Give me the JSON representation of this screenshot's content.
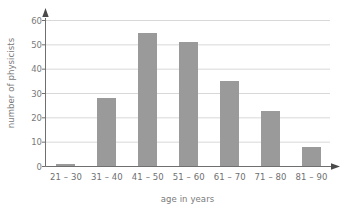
{
  "chart_data": {
    "type": "bar",
    "title": "",
    "subtitle": "",
    "xlabel": "age in years",
    "ylabel": "number of physicists",
    "categories": [
      "21 – 30",
      "31 – 40",
      "41 – 50",
      "51 – 60",
      "61 – 70",
      "71 – 80",
      "81 – 90"
    ],
    "values": [
      1,
      28,
      55,
      51,
      35,
      23,
      8
    ],
    "ylim": [
      0,
      60
    ],
    "ytick_labels": [
      "0",
      "10",
      "20",
      "30",
      "40",
      "50",
      "60"
    ],
    "ytick_values": [
      0,
      10,
      20,
      30,
      40,
      50,
      60
    ],
    "grid": "horizontal",
    "legend": "none",
    "bar_color": "#9a9a9a",
    "grid_color": "#d8d8d8",
    "axis_color": "#6f6f6f",
    "text_color": "#7a7a7a",
    "background": "#ffffff",
    "axis_arrows": true
  }
}
